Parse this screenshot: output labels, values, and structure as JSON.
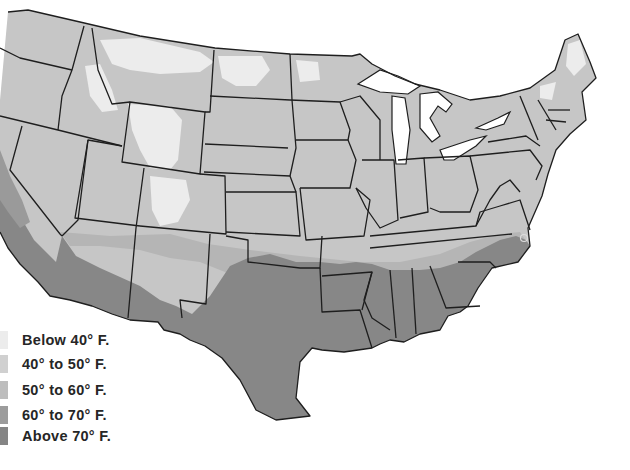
{
  "map": {
    "subject": "United States climate zones map",
    "colors": {
      "background": "#ffffff",
      "below_40": "#ececec",
      "40_to_50": "#c9c9c9",
      "50_to_60": "#b8b8b8",
      "60_to_70": "#9a9a9a",
      "above_70": "#858585",
      "border": "#1e1e1e"
    }
  },
  "legend": {
    "items": [
      {
        "label": "Below 40° F.",
        "color": "#ececec"
      },
      {
        "label": "40° to 50° F.",
        "color": "#d0d0d0"
      },
      {
        "label": "50° to 60° F.",
        "color": "#bdbdbd"
      },
      {
        "label": "60° to 70° F.",
        "color": "#9c9c9c"
      },
      {
        "label": "Above 70° F.",
        "color": "#858585"
      }
    ]
  }
}
